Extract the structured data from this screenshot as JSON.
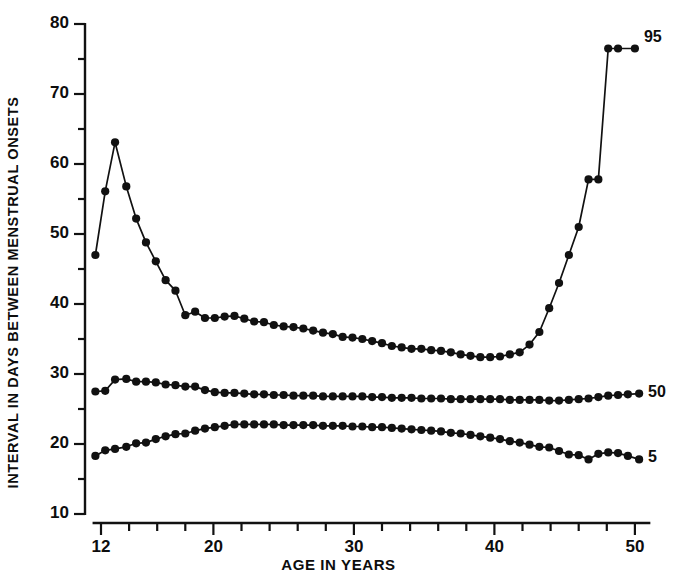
{
  "chart_data": {
    "type": "line",
    "title": "",
    "xlabel": "AGE IN YEARS",
    "ylabel": "INTERVAL IN DAYS BETWEEN MENSTRUAL ONSETS",
    "xlim": [
      11.3,
      51.2
    ],
    "ylim": [
      10,
      80
    ],
    "grid": false,
    "legend_position": "right-of-line-ends",
    "xticks_labeled": [
      12,
      20,
      30,
      40,
      50
    ],
    "xtick_labels": [
      "12",
      "20",
      "30",
      "40",
      "50"
    ],
    "xticks_minor_step": 2,
    "xticks_all": [
      12,
      14,
      16,
      18,
      20,
      22,
      24,
      26,
      28,
      30,
      32,
      34,
      36,
      38,
      40,
      42,
      44,
      46,
      48,
      50
    ],
    "yticks_labeled": [
      10,
      20,
      30,
      40,
      50,
      60,
      70,
      80
    ],
    "ytick_labels": [
      "10",
      "20",
      "30",
      "40",
      "50",
      "60",
      "70",
      "80"
    ],
    "yticks_minor_step": 5,
    "yticks_all": [
      10,
      15,
      20,
      25,
      30,
      35,
      40,
      45,
      50,
      55,
      60,
      65,
      70,
      75,
      80
    ],
    "marker": "filled-circle",
    "line_color": "#111111",
    "series": [
      {
        "name": "95",
        "label": "95",
        "label_value": 95,
        "x": [
          11.6,
          12.3,
          13.0,
          13.8,
          14.5,
          15.2,
          15.9,
          16.6,
          17.3,
          18.0,
          18.7,
          19.4,
          20.1,
          20.8,
          21.5,
          22.2,
          22.9,
          23.6,
          24.3,
          25.0,
          25.7,
          26.4,
          27.1,
          27.8,
          28.5,
          29.2,
          29.9,
          30.6,
          31.3,
          32.0,
          32.7,
          33.4,
          34.1,
          34.8,
          35.5,
          36.2,
          36.9,
          37.6,
          38.3,
          39.0,
          39.7,
          40.4,
          41.1,
          41.8,
          42.5,
          43.2,
          43.9,
          44.6,
          45.3,
          46.0,
          46.7,
          47.4,
          48.1,
          48.8,
          50.0
        ],
        "y": [
          47.0,
          56.1,
          63.1,
          56.8,
          52.2,
          48.8,
          46.1,
          43.4,
          41.9,
          38.4,
          38.9,
          38.0,
          38.0,
          38.2,
          38.3,
          37.9,
          37.5,
          37.4,
          37.0,
          36.8,
          36.7,
          36.5,
          36.2,
          35.9,
          35.7,
          35.3,
          35.2,
          35.0,
          34.7,
          34.4,
          34.0,
          33.8,
          33.6,
          33.6,
          33.4,
          33.3,
          33.1,
          32.8,
          32.6,
          32.4,
          32.4,
          32.5,
          32.8,
          33.1,
          34.2,
          36.0,
          39.4,
          43.0,
          47.0,
          51.0,
          57.8,
          57.8,
          76.5,
          76.5,
          76.5
        ]
      },
      {
        "name": "50",
        "label": "50",
        "label_value": 50,
        "x": [
          11.6,
          12.3,
          13.0,
          13.8,
          14.5,
          15.2,
          15.9,
          16.6,
          17.3,
          18.0,
          18.7,
          19.4,
          20.1,
          20.8,
          21.5,
          22.2,
          22.9,
          23.6,
          24.3,
          25.0,
          25.7,
          26.4,
          27.1,
          27.8,
          28.5,
          29.2,
          29.9,
          30.6,
          31.3,
          32.0,
          32.7,
          33.4,
          34.1,
          34.8,
          35.5,
          36.2,
          36.9,
          37.6,
          38.3,
          39.0,
          39.7,
          40.4,
          41.1,
          41.8,
          42.5,
          43.2,
          43.9,
          44.6,
          45.3,
          46.0,
          46.7,
          47.4,
          48.1,
          48.8,
          49.5,
          50.3
        ],
        "y": [
          27.5,
          27.6,
          29.2,
          29.3,
          28.9,
          28.9,
          28.8,
          28.5,
          28.4,
          28.2,
          28.2,
          27.7,
          27.4,
          27.3,
          27.3,
          27.2,
          27.1,
          27.1,
          27.0,
          27.0,
          26.9,
          26.9,
          26.9,
          26.8,
          26.8,
          26.8,
          26.8,
          26.8,
          26.7,
          26.7,
          26.6,
          26.6,
          26.6,
          26.5,
          26.5,
          26.5,
          26.4,
          26.4,
          26.4,
          26.4,
          26.4,
          26.4,
          26.3,
          26.3,
          26.3,
          26.3,
          26.2,
          26.2,
          26.3,
          26.4,
          26.5,
          26.7,
          26.9,
          27.0,
          27.1,
          27.2
        ]
      },
      {
        "name": "5",
        "label": "5",
        "label_value": 5,
        "x": [
          11.6,
          12.3,
          13.0,
          13.8,
          14.5,
          15.2,
          15.9,
          16.6,
          17.3,
          18.0,
          18.7,
          19.4,
          20.1,
          20.8,
          21.5,
          22.2,
          22.9,
          23.6,
          24.3,
          25.0,
          25.7,
          26.4,
          27.1,
          27.8,
          28.5,
          29.2,
          29.9,
          30.6,
          31.3,
          32.0,
          32.7,
          33.4,
          34.1,
          34.8,
          35.5,
          36.2,
          36.9,
          37.6,
          38.3,
          39.0,
          39.7,
          40.4,
          41.1,
          41.8,
          42.5,
          43.2,
          43.9,
          44.6,
          45.3,
          46.0,
          46.7,
          47.4,
          48.1,
          48.8,
          49.5,
          50.3
        ],
        "y": [
          18.3,
          19.1,
          19.3,
          19.6,
          20.1,
          20.2,
          20.7,
          21.1,
          21.4,
          21.5,
          21.9,
          22.2,
          22.4,
          22.6,
          22.8,
          22.8,
          22.8,
          22.8,
          22.8,
          22.7,
          22.7,
          22.7,
          22.7,
          22.6,
          22.6,
          22.6,
          22.5,
          22.5,
          22.4,
          22.4,
          22.3,
          22.2,
          22.1,
          22.0,
          21.9,
          21.8,
          21.6,
          21.5,
          21.3,
          21.1,
          20.9,
          20.7,
          20.4,
          20.2,
          19.9,
          19.6,
          19.5,
          19.0,
          18.5,
          18.4,
          17.8,
          18.6,
          18.8,
          18.7,
          18.3,
          17.8
        ]
      }
    ]
  },
  "labels": {
    "y_axis_title": "INTERVAL IN DAYS BETWEEN MENSTRUAL ONSETS",
    "x_axis_title": "AGE IN YEARS",
    "series_95": "95",
    "series_50": "50",
    "series_5": "5"
  }
}
